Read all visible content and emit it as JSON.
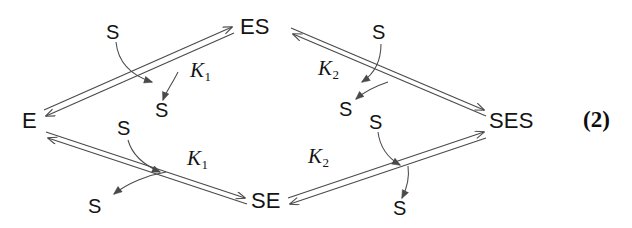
{
  "diagram": {
    "equation_number": "(2)",
    "line_color": "#4a4a4a",
    "text_color": "#141414",
    "nodes": {
      "enzyme": "E",
      "enzyme_substrate_top": "ES",
      "substrate_enzyme_bottom": "SE",
      "substrate_enzyme_substrate": "SES"
    },
    "constants": {
      "k1_upper": {
        "symbol": "K",
        "subscript": "1"
      },
      "k2_upper": {
        "symbol": "K",
        "subscript": "2"
      },
      "k1_lower": {
        "symbol": "K",
        "subscript": "1"
      },
      "k2_lower": {
        "symbol": "K",
        "subscript": "2"
      }
    },
    "substrates": {
      "upper_left_in": "S",
      "upper_left_out": "S",
      "upper_right_in": "S",
      "upper_right_out": "S",
      "lower_left_in": "S",
      "lower_left_out": "S",
      "lower_right_in": "S",
      "lower_right_out": "S"
    }
  }
}
